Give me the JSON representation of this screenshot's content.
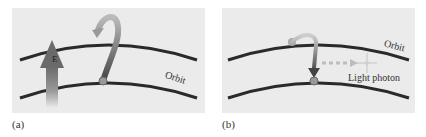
{
  "figure": {
    "panels": [
      {
        "id": "a",
        "caption": "(a)",
        "labels": {
          "field": "E",
          "orbit": "Orbit"
        },
        "description": "Electric field E excites electron from lower orbit to upper orbit"
      },
      {
        "id": "b",
        "caption": "(b)",
        "labels": {
          "orbit": "Orbit",
          "photon": "Light photon"
        },
        "description": "Electron falls from upper orbit to lower orbit emitting a light photon"
      }
    ],
    "colors": {
      "panel_bg": "#ebebeb",
      "orbit": "#2a2a2a",
      "arrow": "#555555",
      "electron": "#888888"
    }
  }
}
